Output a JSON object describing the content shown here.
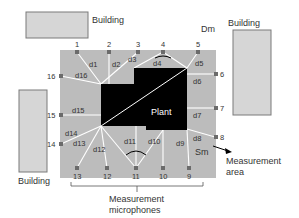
{
  "colors": {
    "building_fill": "#d6d6d6",
    "building_stroke": "#7a7a7a",
    "area_fill": "#bcbcbc",
    "plant_fill": "#000000",
    "mic_fill": "#6b6b6b",
    "line_color": "#ffffff",
    "text_color": "#333333"
  },
  "labels": {
    "building_top": "Building",
    "building_right": "Building",
    "building_left": "Building",
    "dm": "Dm",
    "sm": "Sm",
    "plant": "Plant",
    "measurement_area_line1": "Measurement",
    "measurement_area_line2": "area",
    "microphones_line1": "Measurement",
    "microphones_line2": "microphones"
  },
  "microphones": [
    {
      "id": "1",
      "x": 77,
      "y": 52
    },
    {
      "id": "2",
      "x": 109,
      "y": 52
    },
    {
      "id": "3",
      "x": 138,
      "y": 52
    },
    {
      "id": "4",
      "x": 163,
      "y": 52
    },
    {
      "id": "5",
      "x": 198,
      "y": 52
    },
    {
      "id": "6",
      "x": 215,
      "y": 74
    },
    {
      "id": "7",
      "x": 215,
      "y": 108
    },
    {
      "id": "8",
      "x": 215,
      "y": 137
    },
    {
      "id": "9",
      "x": 189,
      "y": 168
    },
    {
      "id": "10",
      "x": 163,
      "y": 168
    },
    {
      "id": "11",
      "x": 136,
      "y": 168
    },
    {
      "id": "12",
      "x": 107,
      "y": 168
    },
    {
      "id": "13",
      "x": 77,
      "y": 168
    },
    {
      "id": "14",
      "x": 61,
      "y": 144
    },
    {
      "id": "15",
      "x": 61,
      "y": 115
    },
    {
      "id": "16",
      "x": 61,
      "y": 76
    }
  ],
  "distances": [
    "d1",
    "d2",
    "d3",
    "d4",
    "d5",
    "d6",
    "d7",
    "d8",
    "d9",
    "d10",
    "d11",
    "d12",
    "d13",
    "d14",
    "d15",
    "d16"
  ]
}
